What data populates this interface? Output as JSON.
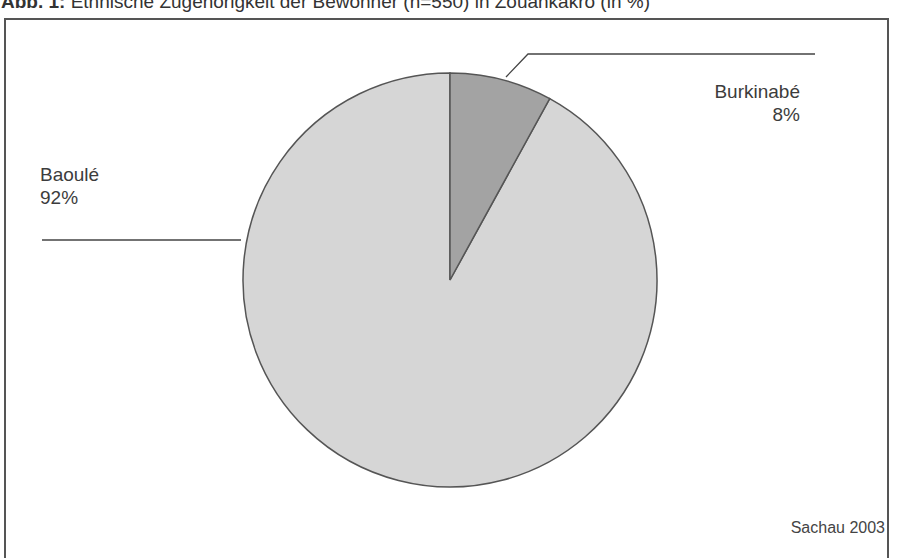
{
  "title": {
    "prefix": "Abb. 1:",
    "text": " Ethnische Zugehörigkeit der Bewohner (n=550) in Zouankakro (in %)"
  },
  "source": "Sachau 2003",
  "labels": {
    "baoule": {
      "name": "Baoulé",
      "pct": "92%"
    },
    "burkinabe": {
      "name": "Burkinabé",
      "pct": "8%"
    }
  },
  "colors": {
    "baoule": "#d6d6d6",
    "burkinabe": "#a3a3a3",
    "outline": "#555555"
  },
  "chart_data": {
    "type": "pie",
    "title": "Ethnische Zugehörigkeit der Bewohner (n=550) in Zouankakro (in %)",
    "categories": [
      "Burkinabé",
      "Baoulé"
    ],
    "values": [
      8,
      92
    ],
    "labels": [
      "Burkinabé 8%",
      "Baoulé 92%"
    ],
    "start_angle": "12 o'clock, clockwise",
    "legend": "none (leader-line data labels)",
    "annotation": "Sachau 2003"
  }
}
